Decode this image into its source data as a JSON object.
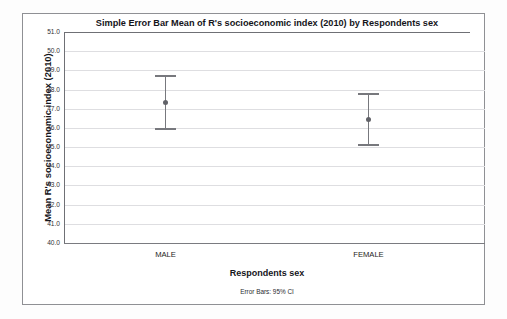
{
  "chart_data": {
    "type": "scatter",
    "title": "Simple Error Bar Mean of R's socioeconomic index (2010) by Respondents sex",
    "xlabel": "Respondents sex",
    "ylabel": "Mean R's socioeconomic index (2010)",
    "footnote": "Error Bars: 95% CI",
    "categories": [
      "MALE",
      "FEMALE"
    ],
    "values": [
      47.35,
      46.45
    ],
    "error_low": [
      45.98,
      45.15
    ],
    "error_high": [
      48.75,
      47.8
    ],
    "ylim": [
      40.0,
      51.0
    ],
    "ytick_step": 1.0,
    "yticks": [
      "51.0",
      "50.0",
      "49.0",
      "48.0",
      "47.0",
      "46.0",
      "45.0",
      "44.0",
      "43.0",
      "42.0",
      "41.0",
      "40.0"
    ],
    "ytick_values": [
      51.0,
      50.0,
      49.0,
      48.0,
      47.0,
      46.0,
      45.0,
      44.0,
      43.0,
      42.0,
      41.0,
      40.0
    ],
    "grid": true,
    "legend": "none",
    "error_bar_type": "95% CI",
    "colors": {
      "marker": "#616268",
      "error_line": "#77787d",
      "gridline": "#dedee1",
      "axis": "#6f7075",
      "border": "#8f9094",
      "background": "#ffffff",
      "text": "#15151a"
    }
  }
}
